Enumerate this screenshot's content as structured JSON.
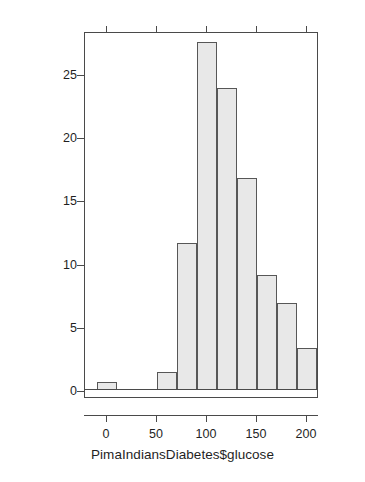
{
  "chart_data": {
    "type": "bar",
    "chart_subtype": "histogram",
    "title": "",
    "xlabel": "PimaIndiansDiabetes$glucose",
    "ylabel": "Percent of Total",
    "bin_width": 20,
    "bin_starts": [
      -10,
      10,
      30,
      50,
      70,
      90,
      110,
      130,
      150,
      170,
      190
    ],
    "bin_ends": [
      10,
      30,
      50,
      70,
      90,
      110,
      130,
      150,
      170,
      190,
      210
    ],
    "categories": [
      "-10 to 10",
      "10 to 30",
      "30 to 50",
      "50 to 70",
      "70 to 90",
      "90 to 110",
      "110 to 130",
      "130 to 150",
      "150 to 170",
      "170 to 190",
      "190 to 210"
    ],
    "values": [
      0.65,
      0,
      0,
      1.4,
      11.6,
      27.5,
      23.9,
      16.8,
      9.1,
      6.9,
      3.3
    ],
    "xlim": [
      -22,
      212
    ],
    "ylim": [
      -0.55,
      28.4
    ],
    "xticks": [
      0,
      50,
      100,
      150,
      200
    ],
    "xticklabels": [
      "0",
      "50",
      "100",
      "150",
      "200"
    ],
    "yticks": [
      0,
      5,
      10,
      15,
      20,
      25
    ],
    "yticklabels": [
      "0",
      "5",
      "10",
      "15",
      "20",
      "25"
    ],
    "grid": false,
    "legend": null,
    "bar_fill_color": "#e8e8e8",
    "bar_border_color": "#575757",
    "axis_color": "#4a4a4a",
    "background_color": "#ffffff"
  }
}
